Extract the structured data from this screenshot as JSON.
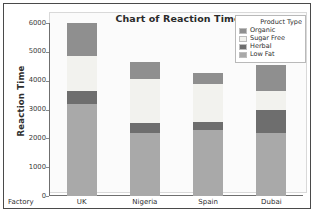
{
  "chart_data": {
    "type": "bar",
    "subtype": "stacked-bar",
    "title": "Chart of Reaction Time",
    "xlabel": "Factory",
    "ylabel": "Reaction Time",
    "categories": [
      "UK",
      "Nigeria",
      "Spain",
      "Dubai"
    ],
    "ylim": [
      0,
      6000
    ],
    "yticks": [
      6000,
      5000,
      4000,
      3000,
      2000,
      1000,
      0
    ],
    "ytick_labels": [
      "6000",
      "5000",
      "4000",
      "3000",
      "2000",
      "1000",
      "0"
    ],
    "grid": false,
    "legend_title": "Product Type",
    "legend_position": "top-right",
    "stack_order_bottom_to_top": [
      "Low Fat",
      "Herbal",
      "Sugar Free",
      "Organic"
    ],
    "series": [
      {
        "name": "Organic",
        "color": "#8f8f8f",
        "values": [
          1150,
          600,
          350,
          900
        ]
      },
      {
        "name": "Sugar Free",
        "color": "#f2f2ee",
        "values": [
          1200,
          1500,
          1350,
          650
        ]
      },
      {
        "name": "Herbal",
        "color": "#6e6e6e",
        "values": [
          450,
          350,
          250,
          800
        ]
      },
      {
        "name": "Low Fat",
        "color": "#a9a9a9",
        "values": [
          3200,
          2200,
          2300,
          2200
        ]
      }
    ],
    "totals": [
      6000,
      4650,
      4250,
      4550
    ]
  },
  "legend": {
    "title": "Product Type",
    "entries": [
      {
        "label": "Organic",
        "color": "#8f8f8f"
      },
      {
        "label": "Sugar Free",
        "color": "#f2f2ee"
      },
      {
        "label": "Herbal",
        "color": "#6e6e6e"
      },
      {
        "label": "Low Fat",
        "color": "#a9a9a9"
      }
    ]
  },
  "axes": {
    "y_title": "Reaction Time",
    "x_title": "Factory",
    "y_ticks": [
      "6000",
      "5000",
      "4000",
      "3000",
      "2000",
      "1000",
      "0"
    ],
    "x_ticks": [
      "UK",
      "Nigeria",
      "Spain",
      "Dubai"
    ]
  }
}
